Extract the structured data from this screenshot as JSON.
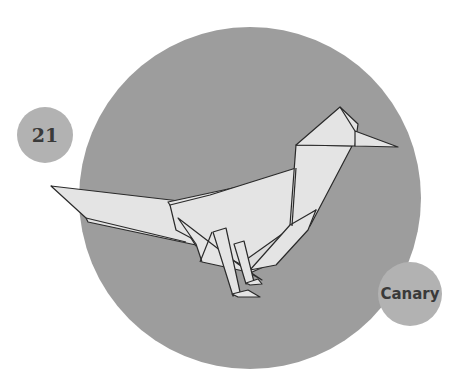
{
  "page_number": "21",
  "model_name": "Canary",
  "colors": {
    "background": "#ffffff",
    "big_circle": "#9d9d9d",
    "badge_circle": "#b2b2b2",
    "paper": "#e4e4e4",
    "paper_shade": "#d6d6d6",
    "outline": "#2a2a2a",
    "text": "#3a3a3a"
  },
  "illustration": {
    "subject": "origami-bird",
    "description": "Folded paper canary standing in profile, facing right"
  }
}
